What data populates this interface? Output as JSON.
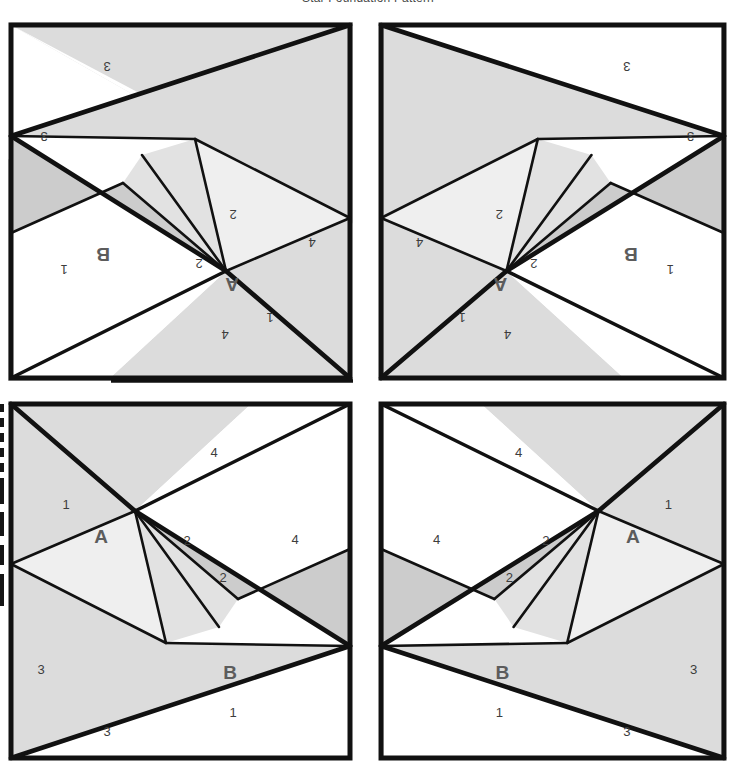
{
  "title": "Star Foundation Pattern",
  "colors": {
    "ink": "#111111",
    "paper": "#ffffff",
    "shade_light": "#fbfbfb",
    "shade_1": "#efefef",
    "shade_2": "#e2e2e2",
    "shade_3": "#dcdcdc",
    "shade_4": "#cccccc",
    "number_text": "#3d3d3d",
    "unit_text": "#5c5c5c"
  },
  "panels": [
    {
      "id": "top-left",
      "name": "panel-top-left",
      "orientation": "rotated-180",
      "units": [
        "A",
        "B"
      ],
      "sections": [
        "1",
        "2",
        "2",
        "3",
        "3",
        "4",
        "4"
      ],
      "labels": {
        "unit_a": "A",
        "unit_b": "B",
        "a_piece_1": "1",
        "b_piece_1": "1",
        "piece_2_upper": "2",
        "piece_2_lower": "2",
        "piece_3_upper": "3",
        "piece_3_lower": "3",
        "piece_4_right": "4",
        "piece_4_bottom": "4"
      }
    },
    {
      "id": "top-right",
      "name": "panel-top-right",
      "orientation": "rotated-180-mirrored",
      "units": [
        "A",
        "B"
      ],
      "sections": [
        "1",
        "2",
        "2",
        "3",
        "3",
        "4",
        "4"
      ],
      "labels": {
        "unit_a": "A",
        "unit_b": "B",
        "a_piece_1": "1",
        "b_piece_1": "1",
        "piece_2_upper": "2",
        "piece_2_lower": "2",
        "piece_3_upper": "3",
        "piece_3_lower": "3",
        "piece_4_right": "4",
        "piece_4_bottom": "4"
      }
    },
    {
      "id": "bottom-left",
      "name": "panel-bottom-left",
      "orientation": "upright",
      "units": [
        "A",
        "B"
      ],
      "sections": [
        "1",
        "2",
        "2",
        "3",
        "3",
        "4",
        "4"
      ],
      "labels": {
        "unit_a": "A",
        "unit_b": "B",
        "a_piece_1": "1",
        "b_piece_1": "1",
        "piece_2_upper": "2",
        "piece_2_lower": "2",
        "piece_3_upper": "3",
        "piece_3_lower": "3",
        "piece_4_right": "4",
        "piece_4_bottom": "4"
      }
    },
    {
      "id": "bottom-right",
      "name": "panel-bottom-right",
      "orientation": "mirrored",
      "units": [
        "A",
        "B"
      ],
      "sections": [
        "1",
        "2",
        "2",
        "3",
        "3",
        "4",
        "4"
      ],
      "labels": {
        "unit_a": "A",
        "unit_b": "B",
        "a_piece_1": "1",
        "b_piece_1": "1",
        "piece_2_upper": "2",
        "piece_2_lower": "2",
        "piece_3_upper": "3",
        "piece_3_lower": "3",
        "piece_4_right": "4",
        "piece_4_bottom": "4"
      }
    }
  ]
}
